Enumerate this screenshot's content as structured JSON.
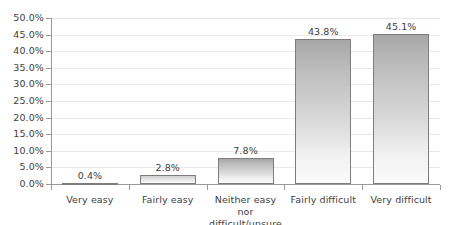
{
  "chart_data": {
    "type": "bar",
    "title": "",
    "subtitle": "",
    "xlabel": "",
    "ylabel": "",
    "categories": [
      "Very easy",
      "Fairly easy",
      "Neither easy nor difficult/unsure",
      "Fairly difficult",
      "Very difficult"
    ],
    "category_lines": [
      [
        "Very easy"
      ],
      [
        "Fairly easy"
      ],
      [
        "Neither easy nor",
        "difficult/unsure"
      ],
      [
        "Fairly difficult"
      ],
      [
        "Very difficult"
      ]
    ],
    "values": [
      0.4,
      2.8,
      7.8,
      43.8,
      45.1
    ],
    "value_labels": [
      "0.4%",
      "2.8%",
      "7.8%",
      "43.8%",
      "45.1%"
    ],
    "ylim": [
      0,
      50
    ],
    "ytick_values": [
      0,
      5,
      10,
      15,
      20,
      25,
      30,
      35,
      40,
      45,
      50
    ],
    "ytick_labels": [
      "0.0%",
      "5.0%",
      "10.0%",
      "15.0%",
      "20.0%",
      "25.0%",
      "30.0%",
      "35.0%",
      "40.0%",
      "45.0%",
      "50.0%"
    ],
    "grid": true,
    "legend": false,
    "legend_position": "none",
    "colors": {
      "bar_gradient_top": "#a7a7a7",
      "bar_gradient_bottom": "#fbfbfb",
      "bar_border": "#7d7d7d",
      "gridline": "#e9e9e9",
      "axis_line": "#9a9a9a",
      "text": "#404040",
      "background": "#ffffff"
    }
  }
}
